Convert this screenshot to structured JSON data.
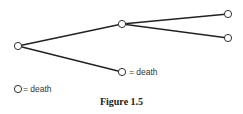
{
  "figure": {
    "caption": "Figure 1.5",
    "nodes": [
      {
        "id": "root",
        "x": 18,
        "y": 46
      },
      {
        "id": "middle",
        "x": 122,
        "y": 24
      },
      {
        "id": "top-right",
        "x": 228,
        "y": 14
      },
      {
        "id": "mid-right",
        "x": 228,
        "y": 38
      },
      {
        "id": "bottom",
        "x": 122,
        "y": 72
      }
    ],
    "edges": [
      [
        "root",
        "middle"
      ],
      [
        "root",
        "bottom"
      ],
      [
        "middle",
        "top-right"
      ],
      [
        "middle",
        "mid-right"
      ]
    ],
    "bottom_node_label": "= death",
    "legend": {
      "symbol": "circle",
      "label": "= death"
    }
  }
}
